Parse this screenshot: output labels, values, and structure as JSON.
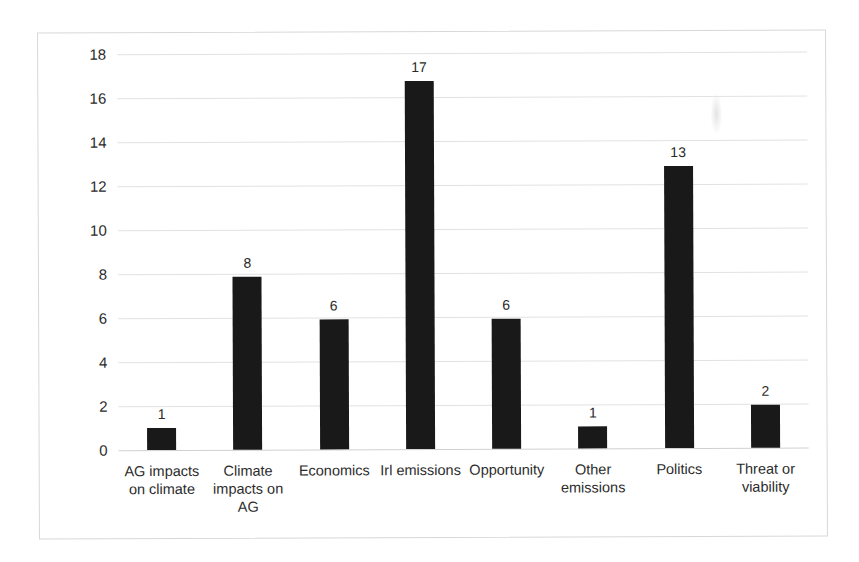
{
  "chart_data": {
    "type": "bar",
    "title": "",
    "subtitle": "",
    "xlabel": "",
    "ylabel": "",
    "categories": [
      "AG impacts on climate",
      "Climate impacts on AG",
      "Economics",
      "Irl emissions",
      "Opportunity",
      "Other emissions",
      "Politics",
      "Threat or viability"
    ],
    "values": [
      1,
      8,
      6,
      17,
      6,
      1,
      13,
      2
    ],
    "data_labels": [
      "1",
      "8",
      "6",
      "17",
      "6",
      "1",
      "13",
      "2"
    ],
    "ylim": [
      0,
      18
    ],
    "ytick_step": 2,
    "yticks": [
      "0",
      "2",
      "4",
      "6",
      "8",
      "10",
      "12",
      "14",
      "16",
      "18"
    ],
    "grid": true,
    "grid_axis": "y",
    "legend": false,
    "legend_position": "none",
    "bar_color": "#191919",
    "gridline_color": "#e2e2e2",
    "axis_color": "#d0d0d0",
    "background_color": "#ffffff",
    "border_color": "#d8d8d8",
    "label_color": "#2b2b2b"
  }
}
